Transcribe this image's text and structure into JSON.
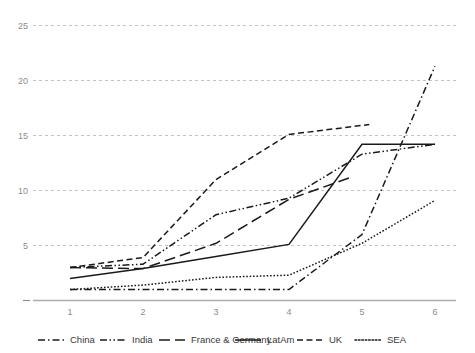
{
  "chart_data": {
    "type": "line",
    "title": "",
    "subtitle": "",
    "xlabel": "",
    "ylabel": "",
    "x": [
      1,
      2,
      3,
      4,
      5,
      6
    ],
    "xtick_labels": [
      "1",
      "2",
      "3",
      "4",
      "5",
      "6"
    ],
    "ytick_labels": [
      "5",
      "10",
      "15",
      "20",
      "25"
    ],
    "ytick_values": [
      5,
      10,
      15,
      20,
      25
    ],
    "xlim": [
      0.55,
      6.45
    ],
    "ylim": [
      0,
      26
    ],
    "grid": "horizontal-dashed",
    "legend_position": "bottom",
    "series": [
      {
        "name": "China",
        "style": "dash-dot",
        "dasharray": "7 3 1.5 3",
        "x": [
          1,
          2,
          3,
          4,
          5,
          6
        ],
        "values": [
          1.0,
          1.0,
          1.0,
          1.0,
          6.0,
          21.3
        ]
      },
      {
        "name": "India",
        "style": "dash-dot-dot",
        "dasharray": "7 2.5 1.5 2.5 1.5 2.5",
        "x": [
          1,
          2,
          3,
          4,
          5,
          6
        ],
        "values": [
          3.0,
          3.3,
          7.8,
          9.3,
          13.3,
          14.2
        ]
      },
      {
        "name": "France & Germany",
        "style": "long-dash",
        "dasharray": "11 5",
        "x": [
          1,
          2,
          3,
          4,
          4.85
        ],
        "values": [
          3.0,
          2.9,
          5.2,
          9.2,
          11.2
        ]
      },
      {
        "name": "LatAm",
        "style": "solid",
        "dasharray": "none",
        "x": [
          1,
          2,
          3,
          4,
          5,
          6
        ],
        "values": [
          2.0,
          2.9,
          4.0,
          5.1,
          14.2,
          14.2
        ]
      },
      {
        "name": "UK",
        "style": "dashed",
        "dasharray": "6 3.5",
        "x": [
          1,
          2,
          3,
          4,
          5.1
        ],
        "values": [
          3.0,
          3.9,
          11.0,
          15.1,
          16.0
        ]
      },
      {
        "name": "SEA",
        "style": "dotted",
        "dasharray": "1.6 1.8",
        "x": [
          1,
          2,
          3,
          4,
          5,
          6
        ],
        "values": [
          1.0,
          1.4,
          2.1,
          2.3,
          5.2,
          9.1
        ]
      }
    ]
  },
  "legend": {
    "items": [
      {
        "label": "China",
        "dasharray": "7 3 1.5 3"
      },
      {
        "label": "India",
        "dasharray": "7 2.5 1.5 2.5 1.5 2.5"
      },
      {
        "label": "France & Germany",
        "dasharray": "11 5"
      },
      {
        "label": "LatAm",
        "dasharray": "none"
      },
      {
        "label": "UK",
        "dasharray": "6 3.5"
      },
      {
        "label": "SEA",
        "dasharray": "1.6 1.8"
      }
    ]
  },
  "axes": {
    "y_labels": [
      "25",
      "20",
      "15",
      "10",
      "5"
    ],
    "x_labels": [
      "1",
      "2",
      "3",
      "4",
      "5",
      "6"
    ]
  },
  "colors": {
    "line": "#1a1a1a",
    "grid": "#b4b4b4",
    "axis": "#adadad",
    "tick_text": "#8c8c8c",
    "legend_text": "#3a3a3a",
    "background": "#ffffff"
  }
}
